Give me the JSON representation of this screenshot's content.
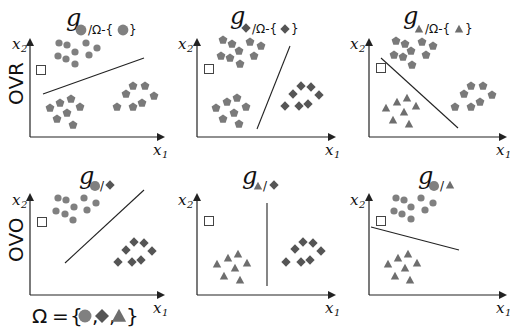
{
  "colors": {
    "circle": "#808080",
    "diamond": "#555555",
    "triangle": "#6e6e6e",
    "pentagon": "#7a7a7a",
    "axis": "#222222",
    "query_point_stroke": "#444444"
  },
  "rows": [
    {
      "label": "OVR"
    },
    {
      "label": "OVO"
    }
  ],
  "axes": {
    "x_label": "x",
    "x_sub": "1",
    "y_label": "x",
    "y_sub": "2"
  },
  "panels": [
    {
      "id": "ovr-circle",
      "title_g": "g",
      "title_sub": "/Ω-{",
      "title_close": "}",
      "classes": [
        "circle",
        "pentagon"
      ],
      "target": "circle"
    },
    {
      "id": "ovr-diamond",
      "title_g": "g",
      "title_sub": "/Ω-{",
      "title_close": "}",
      "classes": [
        "pentagon",
        "diamond"
      ],
      "target": "diamond"
    },
    {
      "id": "ovr-triangle",
      "title_g": "g",
      "title_sub": "/Ω-{",
      "title_close": "}",
      "classes": [
        "pentagon",
        "triangle"
      ],
      "target": "triangle"
    },
    {
      "id": "ovo-circle-diamond",
      "title_g": "g",
      "title_sep": "/",
      "classes": [
        "circle",
        "diamond"
      ]
    },
    {
      "id": "ovo-triangle-diamond",
      "title_g": "g",
      "title_sep": "/",
      "classes": [
        "triangle",
        "diamond"
      ]
    },
    {
      "id": "ovo-circle-triangle",
      "title_g": "g",
      "title_sep": "/",
      "classes": [
        "circle",
        "triangle"
      ]
    }
  ],
  "legend": {
    "omega": "Ω",
    "equals": "=",
    "open": "{",
    "comma": ",",
    "close": "}",
    "members": [
      "circle",
      "diamond",
      "triangle"
    ]
  }
}
